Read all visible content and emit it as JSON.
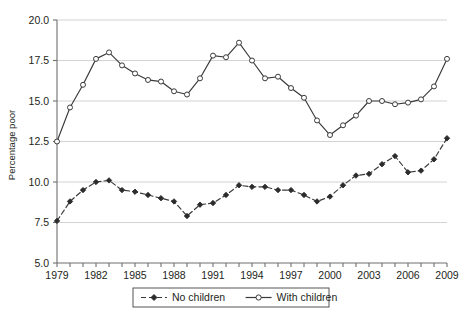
{
  "chart_data": {
    "type": "line",
    "title": "",
    "xlabel": "",
    "ylabel": "Percentage poor",
    "xlim": [
      1979,
      2009
    ],
    "ylim": [
      5.0,
      20.0
    ],
    "grid": true,
    "grid_axis": "y",
    "legend_position": "bottom-center",
    "x": [
      1979,
      1980,
      1981,
      1982,
      1983,
      1984,
      1985,
      1986,
      1987,
      1988,
      1989,
      1990,
      1991,
      1992,
      1993,
      1994,
      1995,
      1996,
      1997,
      1998,
      1999,
      2000,
      2001,
      2002,
      2003,
      2004,
      2005,
      2006,
      2007,
      2008,
      2009
    ],
    "categories": [
      "1979",
      "1980",
      "1981",
      "1982",
      "1983",
      "1984",
      "1985",
      "1986",
      "1987",
      "1988",
      "1989",
      "1990",
      "1991",
      "1992",
      "1993",
      "1994",
      "1995",
      "1996",
      "1997",
      "1998",
      "1999",
      "2000",
      "2001",
      "2002",
      "2003",
      "2004",
      "2005",
      "2006",
      "2007",
      "2008",
      "2009"
    ],
    "yticks": [
      5.0,
      7.5,
      10.0,
      12.5,
      15.0,
      17.5,
      20.0
    ],
    "ytick_labels": [
      "5.0",
      "7.5",
      "10.0",
      "12.5",
      "15.0",
      "17.5",
      "20.0"
    ],
    "xticks": [
      1979,
      1980,
      1981,
      1982,
      1983,
      1984,
      1985,
      1986,
      1987,
      1988,
      1989,
      1990,
      1991,
      1992,
      1993,
      1994,
      1995,
      1996,
      1997,
      1998,
      1999,
      2000,
      2001,
      2002,
      2003,
      2004,
      2005,
      2006,
      2007,
      2008,
      2009
    ],
    "xtick_labels_shown": [
      "1979",
      "1982",
      "1985",
      "1988",
      "1991",
      "1994",
      "1997",
      "2000",
      "2003",
      "2006",
      "2009"
    ],
    "series": [
      {
        "name": "No children",
        "marker": "filled-diamond",
        "linestyle": "dashed",
        "color": "#3a3a3a",
        "values": [
          7.6,
          8.8,
          9.5,
          10.0,
          10.1,
          9.5,
          9.4,
          9.2,
          9.0,
          8.8,
          7.9,
          8.6,
          8.7,
          9.2,
          9.8,
          9.7,
          9.7,
          9.5,
          9.5,
          9.2,
          8.8,
          9.1,
          9.8,
          10.4,
          10.5,
          11.1,
          11.6,
          10.6,
          10.7,
          11.4,
          12.7
        ]
      },
      {
        "name": "With children",
        "marker": "open-circle",
        "linestyle": "solid",
        "color": "#3a3a3a",
        "values": [
          12.5,
          14.6,
          16.0,
          17.6,
          18.0,
          17.2,
          16.7,
          16.3,
          16.2,
          15.6,
          15.4,
          16.4,
          17.8,
          17.7,
          18.6,
          17.5,
          16.4,
          16.5,
          15.8,
          15.2,
          13.8,
          12.9,
          13.5,
          14.1,
          15.0,
          15.0,
          14.8,
          14.9,
          15.1,
          15.9,
          17.6
        ]
      }
    ]
  },
  "legend": {
    "items": [
      {
        "label": "No children",
        "key": "no-children"
      },
      {
        "label": "With children",
        "key": "with-children"
      }
    ]
  },
  "axes": {
    "y_title": "Percentage poor"
  }
}
